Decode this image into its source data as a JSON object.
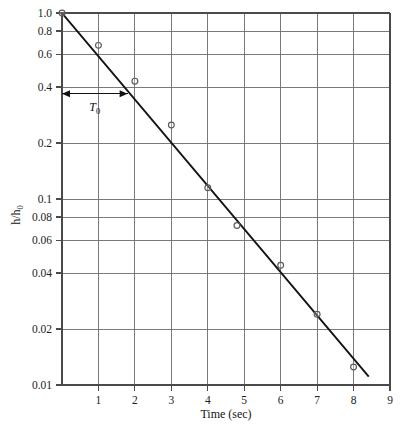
{
  "chart_data": {
    "type": "scatter",
    "title": "",
    "xlabel": "Time (sec)",
    "ylabel": "h/h0",
    "ylabel_display": "h/h₀",
    "yscale": "log",
    "xscale": "linear",
    "xlim": [
      0,
      9
    ],
    "ylim": [
      0.01,
      1.0
    ],
    "grid": true,
    "legend": null,
    "x_ticks": [
      1,
      2,
      3,
      4,
      5,
      6,
      7,
      8,
      9
    ],
    "x_tick_labels": [
      "1",
      "2",
      "3",
      "4",
      "5",
      "6",
      "7",
      "8",
      "9"
    ],
    "y_ticks": [
      1.0,
      0.8,
      0.6,
      0.4,
      0.2,
      0.1,
      0.08,
      0.06,
      0.04,
      0.02,
      0.01
    ],
    "y_tick_labels": [
      "1.0",
      "0.8",
      "0.6",
      "0.4",
      "0.2",
      "0.1",
      "0.08",
      "0.06",
      "0.04",
      "0.02",
      "0.01"
    ],
    "series": [
      {
        "name": "measured",
        "type": "scatter",
        "marker": "open-circle",
        "x": [
          0.0,
          1.0,
          2.0,
          3.0,
          4.0,
          4.8,
          6.0,
          7.0,
          8.0
        ],
        "y": [
          1.0,
          0.67,
          0.43,
          0.25,
          0.115,
          0.072,
          0.044,
          0.024,
          0.0125
        ]
      },
      {
        "name": "fitted-exponential",
        "type": "line",
        "x": [
          0.0,
          8.4
        ],
        "y": [
          1.0,
          0.0112
        ]
      }
    ],
    "annotations": [
      {
        "name": "time-constant",
        "label": "T0",
        "label_display": "T₀",
        "style": "double-headed-arrow",
        "x_start": 0.0,
        "x_end": 1.8,
        "y_level": 0.368
      }
    ]
  },
  "axis": {
    "x_title": "Time (sec)",
    "y_title_main": "h/h",
    "y_title_sub": "0"
  },
  "annotation": {
    "t0_main": "T",
    "t0_sub": "0"
  },
  "colors": {
    "grid": "#6b6b6b",
    "frame": "#4a4a4a",
    "fit_line": "#141414",
    "marker_stroke": "#5a5a5a",
    "text": "#1c1c1c",
    "background": "#ffffff"
  }
}
